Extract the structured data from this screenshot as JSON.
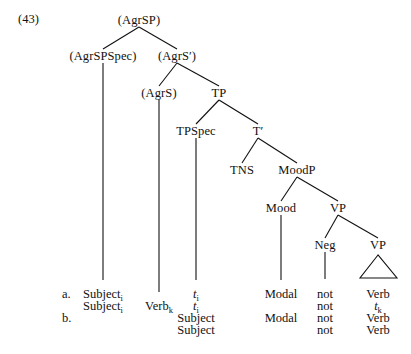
{
  "figure": {
    "example_number": "(43)",
    "ink_color": "#111111",
    "background_color": "#ffffff"
  },
  "tree": {
    "nodes": [
      {
        "id": "agrsp",
        "label": "(AgrSP)",
        "x": 139,
        "y": 20
      },
      {
        "id": "agrspspec",
        "label": "(AgrSPSpec)",
        "x": 103,
        "y": 56
      },
      {
        "id": "agrsbar",
        "label": "(AgrS′)",
        "x": 177,
        "y": 56
      },
      {
        "id": "agrs",
        "label": "(AgrS)",
        "x": 159,
        "y": 93
      },
      {
        "id": "tp",
        "label": "TP",
        "x": 219,
        "y": 93
      },
      {
        "id": "tpspec",
        "label": "TPSpec",
        "x": 196,
        "y": 131
      },
      {
        "id": "tbar",
        "label": "T′",
        "x": 258,
        "y": 131
      },
      {
        "id": "tns",
        "label": "TNS",
        "x": 242,
        "y": 170
      },
      {
        "id": "moodp",
        "label": "MoodP",
        "x": 297,
        "y": 170
      },
      {
        "id": "mood",
        "label": "Mood",
        "x": 281,
        "y": 208
      },
      {
        "id": "vp_upper",
        "label": "VP",
        "x": 338,
        "y": 208
      },
      {
        "id": "neg",
        "label": "Neg",
        "x": 325,
        "y": 245
      },
      {
        "id": "vp_lower",
        "label": "VP",
        "x": 378,
        "y": 245
      }
    ],
    "branches": [
      {
        "from": "agrsp",
        "to": "agrspspec"
      },
      {
        "from": "agrsp",
        "to": "agrsbar"
      },
      {
        "from": "agrsbar",
        "to": "agrs"
      },
      {
        "from": "agrsbar",
        "to": "tp"
      },
      {
        "from": "tp",
        "to": "tpspec"
      },
      {
        "from": "tp",
        "to": "tbar"
      },
      {
        "from": "tbar",
        "to": "tns"
      },
      {
        "from": "tbar",
        "to": "moodp"
      },
      {
        "from": "moodp",
        "to": "mood"
      },
      {
        "from": "moodp",
        "to": "vp_upper"
      },
      {
        "from": "vp_upper",
        "to": "neg"
      },
      {
        "from": "vp_upper",
        "to": "vp_lower"
      }
    ],
    "stems": [
      {
        "id": "stem-agrspspec",
        "x": 103,
        "y1": 63,
        "y2": 280
      },
      {
        "id": "stem-agrs",
        "x": 159,
        "y1": 100,
        "y2": 292
      },
      {
        "id": "stem-tpspec",
        "x": 196,
        "y1": 138,
        "y2": 280
      },
      {
        "id": "stem-mood",
        "x": 281,
        "y1": 215,
        "y2": 280
      },
      {
        "id": "stem-neg",
        "x": 325,
        "y1": 252,
        "y2": 279
      }
    ],
    "triangle": {
      "id": "vp-triangle",
      "apex_x": 378,
      "apex_y": 255,
      "base_left_x": 360,
      "base_right_x": 397,
      "base_y": 278
    }
  },
  "rows": {
    "row_markers": [
      {
        "label": "a.",
        "x": 62,
        "y": 288
      },
      {
        "label": "b.",
        "x": 62,
        "y": 312
      }
    ],
    "columns": {
      "subject": 103,
      "verb": 159,
      "trace": 196,
      "modal": 281,
      "neg": 325,
      "verb_right": 378
    },
    "lines": [
      {
        "y": 288,
        "cells": [
          {
            "col": "subject",
            "text": "Subject",
            "subscript": "i"
          },
          {
            "col": "verb",
            "text": "",
            "subscript": ""
          },
          {
            "col": "trace",
            "text": "t",
            "subscript": "i",
            "italic": true
          },
          {
            "col": "modal",
            "text": "Modal",
            "subscript": ""
          },
          {
            "col": "neg",
            "text": "not",
            "subscript": ""
          },
          {
            "col": "verb_right",
            "text": "Verb",
            "subscript": ""
          }
        ]
      },
      {
        "y": 300,
        "cells": [
          {
            "col": "subject",
            "text": "Subject",
            "subscript": "i"
          },
          {
            "col": "verb",
            "text": "Verb",
            "subscript": "k"
          },
          {
            "col": "trace",
            "text": "t",
            "subscript": "i",
            "italic": true
          },
          {
            "col": "modal",
            "text": "",
            "subscript": ""
          },
          {
            "col": "neg",
            "text": "not",
            "subscript": ""
          },
          {
            "col": "verb_right",
            "text": "t",
            "subscript": "k",
            "italic": true
          }
        ]
      },
      {
        "y": 312,
        "cells": [
          {
            "col": "subject",
            "text": "",
            "subscript": ""
          },
          {
            "col": "verb",
            "text": "",
            "subscript": ""
          },
          {
            "col": "trace",
            "text": "Subject",
            "subscript": ""
          },
          {
            "col": "modal",
            "text": "Modal",
            "subscript": ""
          },
          {
            "col": "neg",
            "text": "not",
            "subscript": ""
          },
          {
            "col": "verb_right",
            "text": "Verb",
            "subscript": ""
          }
        ]
      },
      {
        "y": 324,
        "cells": [
          {
            "col": "subject",
            "text": "",
            "subscript": ""
          },
          {
            "col": "verb",
            "text": "",
            "subscript": ""
          },
          {
            "col": "trace",
            "text": "Subject",
            "subscript": ""
          },
          {
            "col": "modal",
            "text": "",
            "subscript": ""
          },
          {
            "col": "neg",
            "text": "not",
            "subscript": ""
          },
          {
            "col": "verb_right",
            "text": "Verb",
            "subscript": ""
          }
        ]
      }
    ]
  }
}
